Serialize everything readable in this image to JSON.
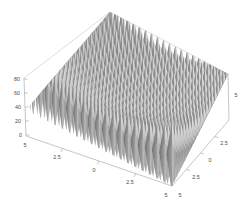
{
  "figure": {
    "kind": "3d-surface-plot",
    "background_color": "#ffffff",
    "surface_color_light": "#d4d4d4",
    "surface_color_mid": "#9a9a9a",
    "surface_color_dark": "#6e6e6e",
    "axis_color": "#8d8d8d",
    "label_color": "#4a4a4a",
    "title": "",
    "subtitle": ""
  },
  "axes": {
    "z": {
      "label": "",
      "ticks": [
        "80",
        "60",
        "40",
        "20",
        "0"
      ],
      "range": [
        0,
        80
      ]
    },
    "x": {
      "label": "",
      "ticks": [
        "5",
        "2.5",
        "0",
        "2.5",
        "5"
      ],
      "range": [
        -5,
        5
      ]
    },
    "y": {
      "label": "",
      "ticks": [
        "5",
        "2.5",
        "0",
        "2.5",
        "5"
      ],
      "range": [
        -5,
        5
      ]
    }
  },
  "chart_data": {
    "type": "surface",
    "title": "",
    "xlabel": "",
    "ylabel": "",
    "zlabel": "",
    "xlim": [
      -5,
      5
    ],
    "ylim": [
      -5,
      5
    ],
    "zlim": [
      0,
      80
    ],
    "xticks": [
      -5,
      -2.5,
      0,
      2.5,
      5
    ],
    "yticks": [
      -5,
      -2.5,
      0,
      2.5,
      5
    ],
    "zticks": [
      0,
      20,
      40,
      60,
      80
    ],
    "xtick_labels": [
      "5",
      "2.5",
      "0",
      "2.5",
      "5"
    ],
    "ytick_labels": [
      "5",
      "2.5",
      "0",
      "2.5",
      "5"
    ],
    "ztick_labels": [
      "0",
      "20",
      "40",
      "60",
      "80"
    ],
    "grid": false,
    "legend": false,
    "colormap": "grayscale",
    "function": "20 + x^2 + y^2 - 10*(cos(2*pi*x) + cos(2*pi*y))",
    "surface": {
      "nx": 21,
      "ny": 21,
      "peak_height_center": 10,
      "peak_height_corner": 80
    },
    "series": [
      {
        "name": "z",
        "x": [
          -5,
          -4.5,
          -4,
          -3.5,
          -3,
          -2.5,
          -2,
          -1.5,
          -1,
          -0.5,
          0,
          0.5,
          1,
          1.5,
          2,
          2.5,
          3,
          3.5,
          4,
          4.5,
          5
        ],
        "y": [
          -5,
          -4.5,
          -4,
          -3.5,
          -3,
          -2.5,
          -2,
          -1.5,
          -1,
          -0.5,
          0,
          0.5,
          1,
          1.5,
          2,
          2.5,
          3,
          3.5,
          4,
          4.5,
          5
        ],
        "z_peaks_along_diagonal": [
          50,
          60.5,
          32,
          44.5,
          18,
          30.5,
          8,
          20.5,
          2,
          10.5,
          0,
          10.5,
          2,
          20.5,
          8,
          30.5,
          18,
          44.5,
          32,
          60.5,
          50
        ],
        "z_min": 0,
        "z_max": 80.7
      }
    ]
  }
}
